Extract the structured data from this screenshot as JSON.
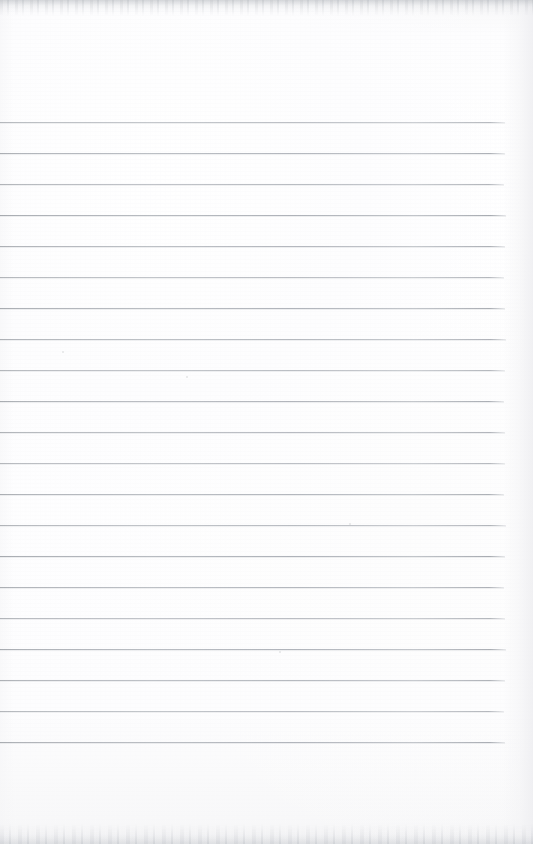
{
  "document": {
    "type": "scanned-lined-notebook-page",
    "title": "Blank ruled notebook page",
    "content_text": "",
    "page_width": 533,
    "page_height": 844,
    "paper_color": "#fcfcfd",
    "rule_color": "#aeb2b8",
    "scan_edge_color": "#c4c7cc",
    "notes": "Empty scanned sheet of ruled paper; no handwriting, headings, or printed text present."
  },
  "ruling": {
    "line_count": 21,
    "first_line_y": 122,
    "line_spacing": 31,
    "line_start_x": 0,
    "line_end_x": 505,
    "line_thickness": 1,
    "lines_y": [
      122,
      153,
      184,
      215,
      246,
      277,
      308,
      339,
      370,
      401,
      432,
      463,
      494,
      525,
      556,
      587,
      618,
      649,
      680,
      711,
      742
    ],
    "line_widths": [
      505,
      505,
      504,
      506,
      505,
      504,
      505,
      506,
      505,
      504,
      505,
      505,
      504,
      506,
      505,
      504,
      505,
      506,
      505,
      504,
      505
    ]
  },
  "margins": {
    "top_blank_height": 122,
    "bottom_blank_height": 102,
    "right_blank_width": 28
  },
  "artifacts": {
    "specks": [
      {
        "x": 62,
        "y": 351,
        "size": 2
      },
      {
        "x": 186,
        "y": 376,
        "size": 2
      },
      {
        "x": 349,
        "y": 523,
        "size": 2
      },
      {
        "x": 279,
        "y": 651,
        "size": 2
      }
    ]
  }
}
